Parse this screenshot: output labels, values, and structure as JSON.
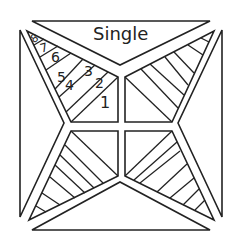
{
  "diagram": {
    "type": "quilt-block-foundation-piecing",
    "title": "Single",
    "colors": {
      "line": "#222222",
      "background": "#ffffff"
    },
    "piece_numbers": [
      {
        "label": "8",
        "x": 31,
        "y": 33,
        "size": 11,
        "rotate": -30
      },
      {
        "label": "7",
        "x": 40,
        "y": 42,
        "size": 12,
        "rotate": -15
      },
      {
        "label": "6",
        "x": 51,
        "y": 50,
        "size": 14,
        "rotate": 0
      },
      {
        "label": "5",
        "x": 57,
        "y": 70,
        "size": 14,
        "rotate": 0
      },
      {
        "label": "4",
        "x": 65,
        "y": 78,
        "size": 14,
        "rotate": 0
      },
      {
        "label": "3",
        "x": 84,
        "y": 64,
        "size": 14,
        "rotate": 0
      },
      {
        "label": "2",
        "x": 95,
        "y": 76,
        "size": 14,
        "rotate": 0
      },
      {
        "label": "1",
        "x": 100,
        "y": 95,
        "size": 16,
        "rotate": 0
      }
    ]
  }
}
